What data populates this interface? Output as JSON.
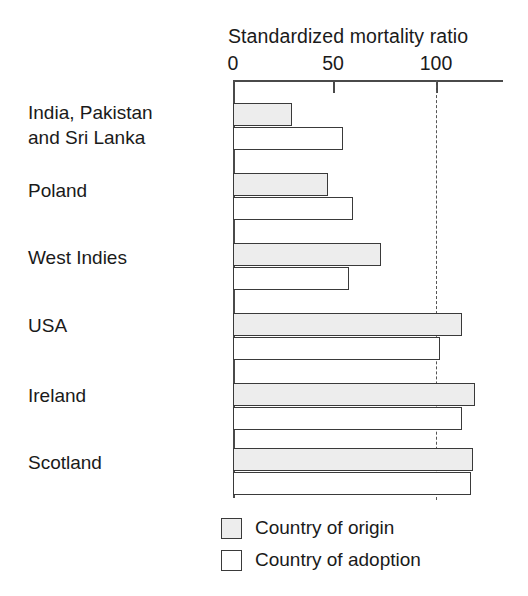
{
  "chart_data": {
    "type": "bar",
    "orientation": "horizontal",
    "title": "Standardized mortality ratio",
    "xlabel": "",
    "ylabel": "",
    "xlim": [
      0,
      133
    ],
    "xticks": [
      0,
      50,
      100
    ],
    "xticklabels": [
      "0",
      "50",
      "100"
    ],
    "grid": false,
    "reference_line": 100,
    "legend_position": "bottom",
    "categories": [
      "India, Pakistan\nand Sri Lanka",
      "Poland",
      "West Indies",
      "USA",
      "Ireland",
      "Scotland"
    ],
    "series": [
      {
        "name": "Country of origin",
        "values": [
          29,
          47,
          73,
          113,
          119,
          118
        ]
      },
      {
        "name": "Country of adoption",
        "values": [
          54,
          59,
          57,
          102,
          113,
          117
        ]
      }
    ]
  },
  "axis": {
    "tick_0": "0",
    "tick_50": "50",
    "tick_100": "100"
  },
  "legend": {
    "items": [
      {
        "label": "Country of origin"
      },
      {
        "label": "Country of adoption"
      }
    ]
  },
  "colors": {
    "origin_fill": "#ededed",
    "adoption_fill": "#ffffff",
    "bar_stroke": "#3a3a3a",
    "axis": "#4a4a4a",
    "text": "#1a1a1a",
    "reference_line": "#555555"
  },
  "geometry": {
    "x_zero_px": 233,
    "x_fifty_px": 333,
    "x_hundred_px": 436,
    "px_per_unit": 2.03,
    "group_tops_px": [
      103,
      173,
      243,
      313,
      383,
      448
    ],
    "bar_height_px": 23,
    "label_tops_px": [
      100,
      178,
      245,
      313,
      383,
      450
    ]
  }
}
